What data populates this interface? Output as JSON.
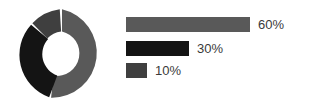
{
  "chart_data": {
    "type": "pie",
    "variant": "donut",
    "title": "",
    "subtitle": "",
    "xlabel": "",
    "ylabel": "",
    "grid": false,
    "legend_position": "right",
    "labels": [
      "60%",
      "30%",
      "10%"
    ],
    "values": [
      60,
      30,
      10
    ],
    "units": "percent",
    "colors": [
      "#595959",
      "#141414",
      "#3f3f3f"
    ],
    "slice_start_angle_deg": 0,
    "slice_gap_deg": 3,
    "inner_radius_ratio": 0.49,
    "annotations": []
  },
  "donut": {
    "name": "donut-chart",
    "segments": [
      {
        "label": "60%",
        "value": 60,
        "color": "#595959"
      },
      {
        "label": "30%",
        "value": 30,
        "color": "#141414"
      },
      {
        "label": "10%",
        "value": 10,
        "color": "#3f3f3f"
      }
    ]
  },
  "legend": {
    "items": [
      {
        "label": "60%",
        "value": 60,
        "color": "#595959",
        "bar_width_px": 124
      },
      {
        "label": "30%",
        "value": 30,
        "color": "#141414",
        "bar_width_px": 63
      },
      {
        "label": "10%",
        "value": 10,
        "color": "#3f3f3f",
        "bar_width_px": 21
      }
    ]
  }
}
